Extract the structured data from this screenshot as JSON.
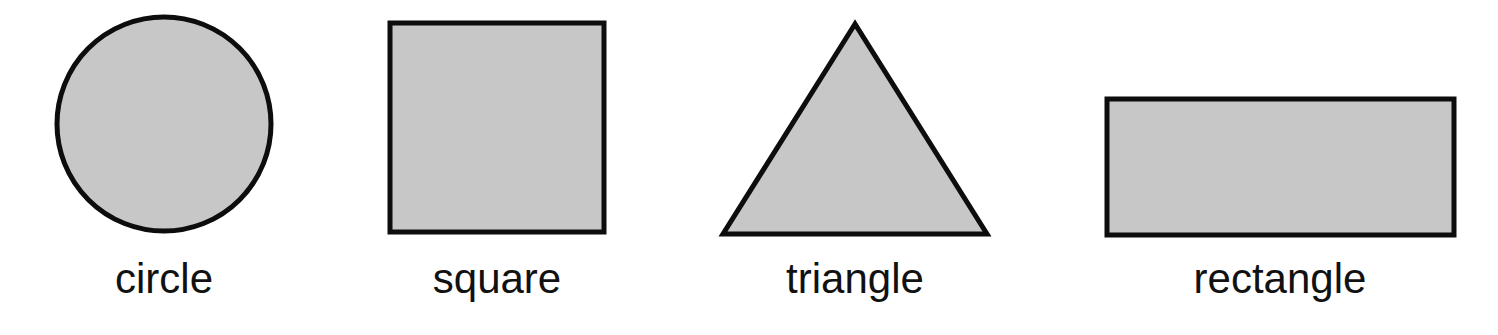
{
  "colors": {
    "fill": "#c7c7c7",
    "stroke": "#0d0d0d",
    "text": "#111111",
    "background": "#ffffff"
  },
  "shapes": [
    {
      "name": "circle",
      "label": "circle"
    },
    {
      "name": "square",
      "label": "square"
    },
    {
      "name": "triangle",
      "label": "triangle"
    },
    {
      "name": "rectangle",
      "label": "rectangle"
    }
  ]
}
